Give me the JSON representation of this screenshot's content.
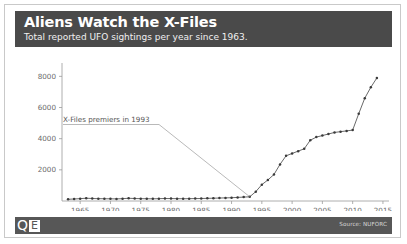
{
  "header": {
    "title": "Aliens Watch the X-Files",
    "subtitle": "Total reported UFO sightings per year since 1963.",
    "background": "#4a4a4a"
  },
  "footer": {
    "logo_primary": "Q",
    "logo_secondary": "E",
    "source": "Source: NUFORC",
    "background": "#575757"
  },
  "chart_data": {
    "type": "line",
    "title": "Aliens Watch the X-Files",
    "subtitle": "Total reported UFO sightings per year since 1963.",
    "xlabel": "",
    "ylabel": "",
    "xlim": [
      1962,
      2016
    ],
    "ylim": [
      0,
      8600
    ],
    "xticks": [
      1965,
      1970,
      1975,
      1980,
      1985,
      1990,
      1995,
      2000,
      2005,
      2010,
      2015
    ],
    "yticks": [
      2000,
      4000,
      6000,
      8000
    ],
    "grid": false,
    "legend": "none",
    "marker": "dot",
    "line_color": "#3a3a3a",
    "x": [
      1963,
      1964,
      1965,
      1966,
      1967,
      1968,
      1969,
      1970,
      1971,
      1972,
      1973,
      1974,
      1975,
      1976,
      1977,
      1978,
      1979,
      1980,
      1981,
      1982,
      1983,
      1984,
      1985,
      1986,
      1987,
      1988,
      1989,
      1990,
      1991,
      1992,
      1993,
      1994,
      1995,
      1996,
      1997,
      1998,
      1999,
      2000,
      2001,
      2002,
      2003,
      2004,
      2005,
      2006,
      2007,
      2008,
      2009,
      2010,
      2011,
      2012,
      2013,
      2014
    ],
    "values": [
      110,
      130,
      150,
      180,
      160,
      150,
      145,
      140,
      135,
      150,
      175,
      160,
      150,
      145,
      140,
      150,
      160,
      155,
      150,
      145,
      150,
      155,
      160,
      170,
      180,
      190,
      200,
      210,
      230,
      250,
      270,
      600,
      1050,
      1350,
      1700,
      2350,
      2900,
      3050,
      3200,
      3350,
      3900,
      4100,
      4200,
      4300,
      4400,
      4450,
      4500,
      4550,
      5600,
      6600,
      7300,
      7900
    ],
    "annotations": [
      {
        "text": "X-Files premiers in 1993",
        "points_to_year": 1993,
        "points_to_value": 270
      }
    ]
  }
}
